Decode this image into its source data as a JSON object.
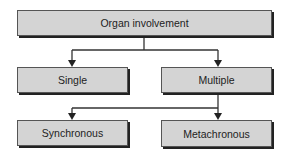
{
  "diagram": {
    "root": {
      "label": "Organ involvement"
    },
    "level1": [
      {
        "label": "Single"
      },
      {
        "label": "Multiple"
      }
    ],
    "level2": [
      {
        "label": "Synchronous"
      },
      {
        "label": "Metachronous"
      }
    ]
  },
  "colors": {
    "box_fill": "#d4d4d4",
    "box_border": "#555555",
    "shadow": "#222222",
    "line": "#333333"
  }
}
